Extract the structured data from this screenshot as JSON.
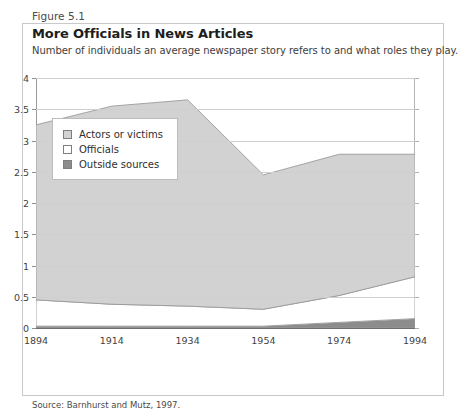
{
  "figure": {
    "number": "Figure 5.1",
    "title": "More Officials in News Articles",
    "subtitle": "Number of individuals an average newspaper story refers to and what roles they play.",
    "source": "Source: Barnhurst and Mutz, 1997."
  },
  "colors": {
    "actors_or_victims": "#d2d2d2",
    "officials": "#ffffff",
    "outside_sources": "#8c8c8c",
    "series_outline": "#9a9a9a",
    "grid": "#cfcfcf",
    "axis": "#6e6e6e",
    "frame": "#c9c9c9"
  },
  "legend": {
    "entries": [
      {
        "label": "Actors or victims",
        "swatch": "#d2d2d2"
      },
      {
        "label": "Officials",
        "swatch": "#ffffff"
      },
      {
        "label": "Outside sources",
        "swatch": "#8c8c8c"
      }
    ]
  },
  "chart_data": {
    "type": "area",
    "title": "More Officials in News Articles",
    "subtitle": "Number of individuals an average newspaper story refers to and what roles they play.",
    "xlabel": "",
    "ylabel": "",
    "x": [
      1894,
      1914,
      1934,
      1954,
      1974,
      1994
    ],
    "categories": [
      "1894",
      "1914",
      "1934",
      "1954",
      "1974",
      "1994"
    ],
    "xlim": [
      1894,
      1994
    ],
    "ylim": [
      0,
      4
    ],
    "yticks": [
      0,
      0.5,
      1,
      1.5,
      2,
      2.5,
      3,
      3.5,
      4
    ],
    "ytick_labels": [
      "0",
      "0.5",
      "1",
      "1.5",
      "2",
      "2.5",
      "3",
      "3.5",
      "4"
    ],
    "xticks": [
      1894,
      1914,
      1934,
      1954,
      1974,
      1994
    ],
    "xtick_labels": [
      "1894",
      "1914",
      "1934",
      "1954",
      "1974",
      "1994"
    ],
    "grid": true,
    "stacked": true,
    "legend_position": "inside-left",
    "series": [
      {
        "name": "Outside sources",
        "color": "#8c8c8c",
        "values": [
          0.03,
          0.03,
          0.03,
          0.03,
          0.09,
          0.15
        ]
      },
      {
        "name": "Officials",
        "color": "#ffffff",
        "values": [
          0.42,
          0.35,
          0.32,
          0.27,
          0.43,
          0.67
        ]
      },
      {
        "name": "Actors or victims",
        "color": "#d2d2d2",
        "values": [
          2.8,
          3.17,
          3.3,
          2.15,
          2.26,
          1.96
        ]
      }
    ],
    "cumulative_tops": {
      "outside_sources": [
        0.03,
        0.03,
        0.03,
        0.03,
        0.09,
        0.15
      ],
      "officials": [
        0.45,
        0.38,
        0.35,
        0.3,
        0.52,
        0.82
      ],
      "total": [
        3.25,
        3.55,
        3.65,
        2.45,
        2.78,
        2.78
      ]
    }
  }
}
